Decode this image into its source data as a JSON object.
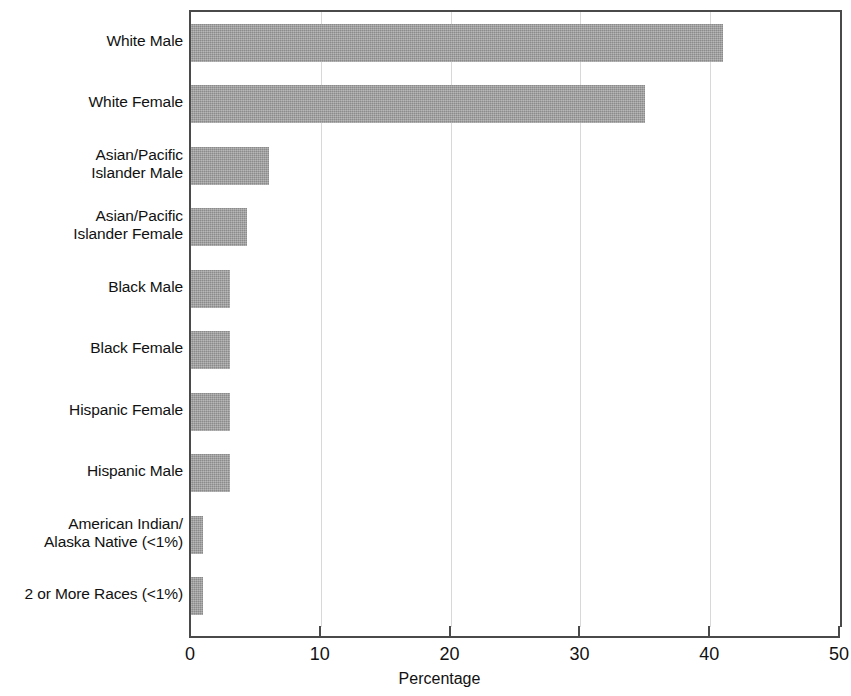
{
  "chart_data": {
    "type": "bar",
    "orientation": "horizontal",
    "title": "",
    "xlabel": "Percentage",
    "ylabel": "",
    "xlim": [
      0,
      50
    ],
    "ylim": null,
    "grid": true,
    "legend": null,
    "bar_color": "#9b9b9b",
    "axis_color": "#4a4a4a",
    "gridline_color": "#d8d8d8",
    "xticks": [
      "0",
      "10",
      "20",
      "30",
      "40",
      "50"
    ],
    "xtick_values": [
      0,
      10,
      20,
      30,
      40,
      50
    ],
    "gridline_values": [
      10,
      20,
      30,
      40
    ],
    "categories": [
      "White Male",
      "White Female",
      "Asian/Pacific Islander Male",
      "Asian/Pacific Islander Female",
      "Black Male",
      "Black Female",
      "Hispanic Female",
      "Hispanic Male",
      "American Indian/Alaska Native (<1%)",
      "2 or More Races (<1%)"
    ],
    "category_lines": [
      [
        "White Male"
      ],
      [
        "White Female"
      ],
      [
        "Asian/Pacific",
        "Islander Male"
      ],
      [
        "Asian/Pacific",
        "Islander Female"
      ],
      [
        "Black Male"
      ],
      [
        "Black Female"
      ],
      [
        "Hispanic Female"
      ],
      [
        "Hispanic Male"
      ],
      [
        "American Indian/",
        "Alaska Native (<1%)"
      ],
      [
        "2 or More Races (<1%)"
      ]
    ],
    "values": [
      41,
      35,
      6,
      4.3,
      3,
      3,
      3,
      3,
      0.9,
      0.9
    ]
  }
}
